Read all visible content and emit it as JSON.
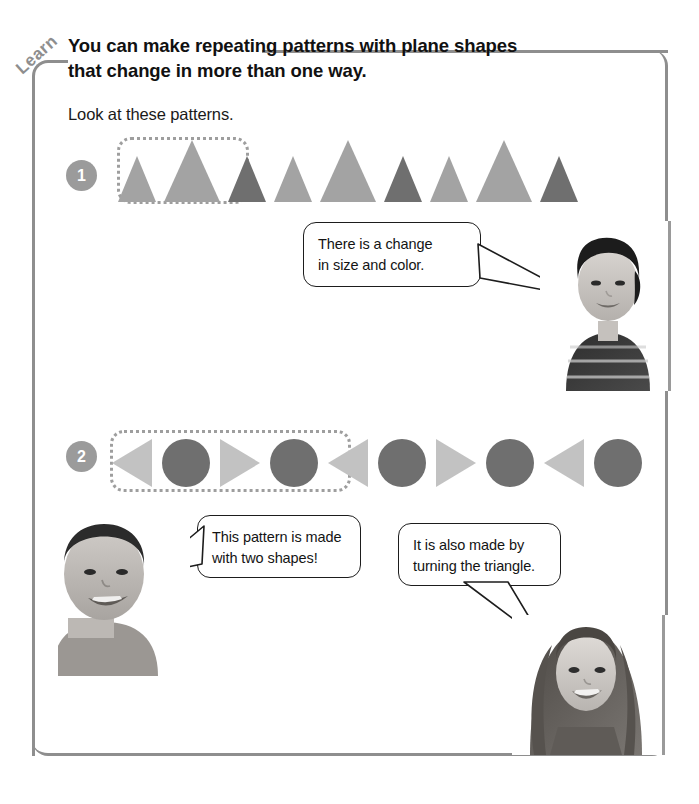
{
  "page": {
    "tab_label": "Learn",
    "heading": "You can make repeating patterns with plane shapes that change in more than one way.",
    "subheading": "Look at these patterns."
  },
  "colors": {
    "frame": "#8e8e8e",
    "badge_bg": "#9b9b9b",
    "badge_text": "#ffffff",
    "shape_light": "#a3a3a3",
    "shape_dark": "#6f6f6f",
    "shape_light_2": "#bdbdbd",
    "dotted_border": "#9e9e9e",
    "bubble_border": "#1d1d1d",
    "text": "#141414"
  },
  "patterns": [
    {
      "number": "1",
      "grouped_count": 3,
      "shapes": [
        {
          "kind": "triangle-up",
          "size": "small",
          "tone": "light",
          "w": 38,
          "h": 46,
          "color": "#a3a3a3"
        },
        {
          "kind": "triangle-up",
          "size": "large",
          "tone": "light",
          "w": 56,
          "h": 62,
          "color": "#a3a3a3"
        },
        {
          "kind": "triangle-up",
          "size": "small",
          "tone": "dark",
          "w": 38,
          "h": 46,
          "color": "#6f6f6f"
        },
        {
          "kind": "triangle-up",
          "size": "small",
          "tone": "light",
          "w": 38,
          "h": 46,
          "color": "#a3a3a3"
        },
        {
          "kind": "triangle-up",
          "size": "large",
          "tone": "light",
          "w": 56,
          "h": 62,
          "color": "#a3a3a3"
        },
        {
          "kind": "triangle-up",
          "size": "small",
          "tone": "dark",
          "w": 38,
          "h": 46,
          "color": "#6f6f6f"
        },
        {
          "kind": "triangle-up",
          "size": "small",
          "tone": "light",
          "w": 38,
          "h": 46,
          "color": "#a3a3a3"
        },
        {
          "kind": "triangle-up",
          "size": "large",
          "tone": "light",
          "w": 56,
          "h": 62,
          "color": "#a3a3a3"
        },
        {
          "kind": "triangle-up",
          "size": "small",
          "tone": "dark",
          "w": 38,
          "h": 46,
          "color": "#6f6f6f"
        }
      ]
    },
    {
      "number": "2",
      "grouped_count": 4,
      "shapes": [
        {
          "kind": "triangle-left",
          "tone": "light",
          "w": 40,
          "h": 48,
          "color": "#c2c2c2"
        },
        {
          "kind": "circle",
          "tone": "dark",
          "w": 48,
          "h": 48,
          "color": "#6f6f6f"
        },
        {
          "kind": "triangle-right",
          "tone": "light",
          "w": 40,
          "h": 48,
          "color": "#c2c2c2"
        },
        {
          "kind": "circle",
          "tone": "dark",
          "w": 48,
          "h": 48,
          "color": "#6f6f6f"
        },
        {
          "kind": "triangle-left",
          "tone": "light",
          "w": 40,
          "h": 48,
          "color": "#c2c2c2"
        },
        {
          "kind": "circle",
          "tone": "dark",
          "w": 48,
          "h": 48,
          "color": "#6f6f6f"
        },
        {
          "kind": "triangle-right",
          "tone": "light",
          "w": 40,
          "h": 48,
          "color": "#c2c2c2"
        },
        {
          "kind": "circle",
          "tone": "dark",
          "w": 48,
          "h": 48,
          "color": "#6f6f6f"
        },
        {
          "kind": "triangle-left",
          "tone": "light",
          "w": 40,
          "h": 48,
          "color": "#c2c2c2"
        },
        {
          "kind": "circle",
          "tone": "dark",
          "w": 48,
          "h": 48,
          "color": "#6f6f6f"
        }
      ]
    }
  ],
  "speech_bubbles": [
    {
      "id": "bubble-1",
      "line1": "There is a change",
      "line2": "in size and color.",
      "tail": "right"
    },
    {
      "id": "bubble-2",
      "line1": "This pattern is made",
      "line2": "with two shapes!",
      "tail": "left"
    },
    {
      "id": "bubble-3",
      "line1": "It is also made by",
      "line2": "turning the triangle.",
      "tail": "down-right"
    }
  ],
  "photos": [
    {
      "id": "photo-boy-asian",
      "alt": "smiling boy with dark hair wearing a striped polo shirt"
    },
    {
      "id": "photo-boy-short",
      "alt": "smiling boy with short cropped hair"
    },
    {
      "id": "photo-girl",
      "alt": "smiling girl with long straight hair"
    }
  ]
}
